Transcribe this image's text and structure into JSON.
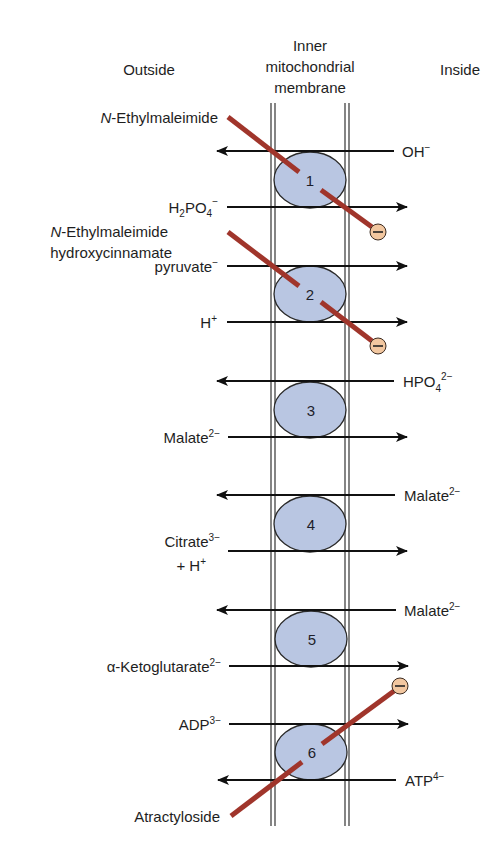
{
  "header": {
    "outside": "Outside",
    "membrane_line1": "Inner",
    "membrane_line2": "mitochondrial",
    "membrane_line3": "membrane",
    "inside": "Inside"
  },
  "colors": {
    "transporter_fill": "#b9c6e2",
    "transporter_stroke": "#2a2a2a",
    "inhibitor_bar": "#a0352b",
    "inhibitor_circle": "#f2c7a0",
    "arrow": "#111111",
    "membrane": "#333333"
  },
  "transporters": [
    {
      "id": "1",
      "cx": 310,
      "cy": 180,
      "left": {
        "text": "H",
        "sub": "2",
        "rest": "PO",
        "sub2": "4",
        "sup": "−",
        "dir": "in",
        "y": 207
      },
      "right": {
        "text": "OH",
        "sup": "−",
        "dir": "out",
        "y": 151
      }
    },
    {
      "id": "2",
      "cx": 310,
      "cy": 293,
      "left_a": {
        "text": "pyruvate",
        "sup": "−",
        "dir": "in",
        "y": 266
      },
      "left_b": {
        "text": "H",
        "sup": "+",
        "dir": "in",
        "y": 322
      }
    },
    {
      "id": "3",
      "cx": 310,
      "cy": 410,
      "right": {
        "text": "HPO",
        "sub": "4",
        "sup": "2−",
        "dir": "out",
        "y": 381
      },
      "left": {
        "text": "Malate",
        "sup": "2−",
        "dir": "in",
        "y": 437
      }
    },
    {
      "id": "4",
      "cx": 310,
      "cy": 524,
      "right": {
        "text": "Malate",
        "sup": "2−",
        "dir": "out",
        "y": 495
      },
      "left": {
        "text": "Citrate",
        "sup": "3−",
        "line2": "+ H",
        "line2_sup": "+",
        "dir": "in",
        "y": 551
      }
    },
    {
      "id": "5",
      "cx": 310,
      "cy": 639,
      "right": {
        "text": "Malate",
        "sup": "2−",
        "dir": "out",
        "y": 610
      },
      "left": {
        "text": "α-Ketoglutarate",
        "sup": "2−",
        "dir": "in",
        "y": 666
      }
    },
    {
      "id": "6",
      "cx": 310,
      "cy": 752,
      "left": {
        "text": "ADP",
        "sup": "3−",
        "dir": "in",
        "y": 724
      },
      "right": {
        "text": "ATP",
        "sup": "4−",
        "dir": "out",
        "y": 780
      }
    }
  ],
  "inhibitors": [
    {
      "name_italic": "N",
      "name_rest": "-Ethylmaleimide",
      "target": "1"
    },
    {
      "name_italic": "N",
      "name_rest": "-Ethylmaleimide",
      "name_line2": "hydroxycinnamate",
      "target": "2"
    },
    {
      "name": "Atractyloside",
      "target": "6"
    }
  ],
  "inhibitor_symbol": "−",
  "labels": {
    "t1_right": "OH",
    "t1_right_sup": "−",
    "t1_left_H": "H",
    "t1_left_2": "2",
    "t1_left_PO": "PO",
    "t1_left_4": "4",
    "t1_left_sup": "−",
    "t2_left_a": "pyruvate",
    "t2_left_a_sup": "−",
    "t2_left_b": "H",
    "t2_left_b_sup": "+",
    "t3_right": "HPO",
    "t3_right_sub": "4",
    "t3_right_sup": "2−",
    "t3_left": "Malate",
    "t3_left_sup": "2−",
    "t4_right": "Malate",
    "t4_right_sup": "2−",
    "t4_left": "Citrate",
    "t4_left_sup": "3−",
    "t4_left2": "+ H",
    "t4_left2_sup": "+",
    "t5_right": "Malate",
    "t5_right_sup": "2−",
    "t5_left": "α-Ketoglutarate",
    "t5_left_sup": "2−",
    "t6_left": "ADP",
    "t6_left_sup": "3−",
    "t6_right": "ATP",
    "t6_right_sup": "4−",
    "inh1_italic": "N",
    "inh1_rest": "-Ethylmaleimide",
    "inh2_italic": "N",
    "inh2_rest": "-Ethylmaleimide",
    "inh2_line2": "hydroxycinnamate",
    "inh3": "Atractyloside"
  }
}
